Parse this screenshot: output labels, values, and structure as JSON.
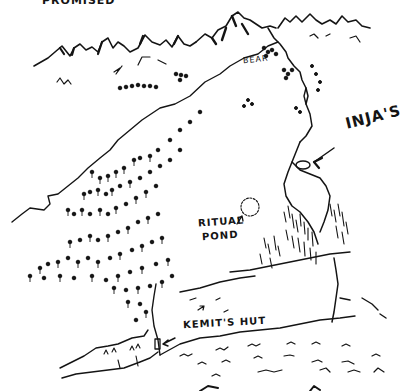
{
  "map": {
    "style": "hand-drawn ink sketch map",
    "ink_color": "#141414",
    "background_color": "#ffffff",
    "labels": {
      "top_truncated": "PROMISED",
      "bear": "BEAR",
      "injas": "INJA'S",
      "ritual_pond_line1": "RITUAL",
      "ritual_pond_line2": "POND",
      "kemits_hut": "KEMIT'S HUT"
    },
    "features": [
      {
        "name": "mountain-range",
        "description": "jagged peaks across the top"
      },
      {
        "name": "bear-area",
        "description": "marked near mountain pass"
      },
      {
        "name": "forest",
        "description": "dense trees on the left slope"
      },
      {
        "name": "ritual-pond",
        "description": "small dotted circle in clearing"
      },
      {
        "name": "injas-location",
        "description": "enclosed valley with arrow pointing in"
      },
      {
        "name": "kemits-hut",
        "description": "small rectangle with arrow at base of slope"
      },
      {
        "name": "water",
        "description": "wavy lines at the bottom"
      },
      {
        "name": "cliff",
        "description": "grassy ridge on the right"
      }
    ]
  }
}
